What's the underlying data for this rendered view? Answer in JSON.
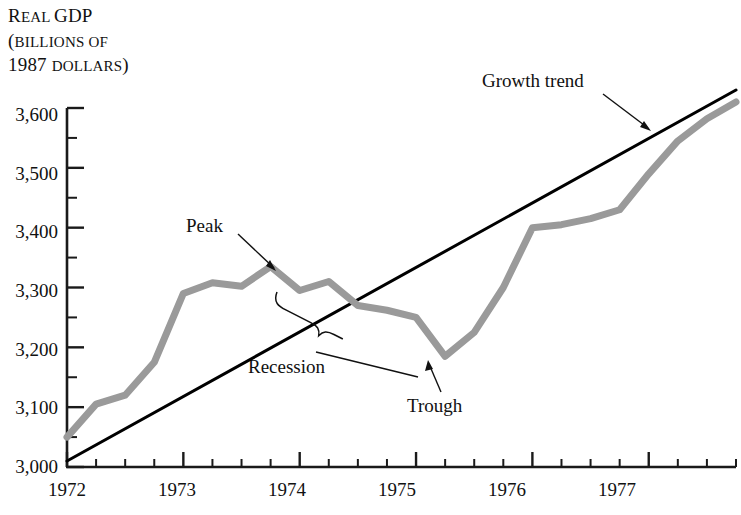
{
  "chart_data": {
    "type": "line",
    "title": "Real GDP (billions of 1987 dollars)",
    "title_lines": [
      {
        "head": "R",
        "rest": "EAL ",
        "head2": "GDP",
        "text": "Real GDP"
      },
      {
        "text": "(billions of"
      },
      {
        "text": "1987 dollars)"
      }
    ],
    "xlabel": "",
    "ylabel": "Real GDP (billions of 1987 dollars)",
    "ylim": [
      3000,
      3600
    ],
    "xlim": [
      1972.0,
      1977.75
    ],
    "grid": false,
    "legend": "none",
    "y_ticks": [
      "3,000",
      "3,100",
      "3,200",
      "3,300",
      "3,400",
      "3,500",
      "3,600"
    ],
    "y_tick_values": [
      3000,
      3100,
      3200,
      3300,
      3400,
      3500,
      3600
    ],
    "y_minor_step": 50,
    "x_ticks": [
      "1972",
      "1973",
      "1974",
      "1975",
      "1976",
      "1977"
    ],
    "x_tick_values": [
      1972,
      1973,
      1974,
      1975,
      1976,
      1977
    ],
    "x_minor_step": 0.25,
    "series": [
      {
        "name": "Real GDP",
        "color": "#9a9a9a",
        "width": 7,
        "x": [
          1972.0,
          1972.25,
          1972.5,
          1972.75,
          1973.0,
          1973.25,
          1973.5,
          1973.75,
          1974.0,
          1974.25,
          1974.5,
          1974.75,
          1975.0,
          1975.25,
          1975.5,
          1975.75,
          1976.0,
          1976.25,
          1976.5,
          1976.75,
          1977.0,
          1977.25,
          1977.5,
          1977.75
        ],
        "values": [
          3050,
          3105,
          3120,
          3175,
          3290,
          3308,
          3302,
          3335,
          3295,
          3310,
          3270,
          3262,
          3250,
          3185,
          3225,
          3300,
          3400,
          3405,
          3415,
          3430,
          3490,
          3545,
          3582,
          3610
        ]
      },
      {
        "name": "Growth trend",
        "color": "#000000",
        "width": 3,
        "x": [
          1972.0,
          1977.75
        ],
        "values": [
          3010,
          3630
        ]
      }
    ],
    "annotations": [
      {
        "name": "peak",
        "label": "Peak",
        "x": 1973.75,
        "y": 3335,
        "label_x": 1973.05,
        "label_y": 3440
      },
      {
        "name": "trough",
        "label": "Trough",
        "x": 1975.25,
        "y": 3185,
        "label_x": 1975.35,
        "label_y": 3090
      },
      {
        "name": "recession",
        "label": "Recession",
        "x": 1974.5,
        "y": 3265,
        "label_x": 1973.55,
        "label_y": 3125
      },
      {
        "name": "growth-trend",
        "label": "Growth trend",
        "x": 1977.0,
        "y": 3540,
        "label_x": 1976.35,
        "label_y": 3640
      }
    ]
  },
  "ytick_labels": {
    "t0": "3,000",
    "t1": "3,100",
    "t2": "3,200",
    "t3": "3,300",
    "t4": "3,400",
    "t5": "3,500",
    "t6": "3,600"
  },
  "xtick_labels": {
    "t0": "1972",
    "t1": "1973",
    "t2": "1974",
    "t3": "1975",
    "t4": "1976",
    "t5": "1977"
  },
  "title": {
    "line1_cap": "R",
    "line1_small": "EAL ",
    "line1_rest": "GDP",
    "line2_cap": "(",
    "line2_small": "BILLIONS OF",
    "line3_num": "1987 ",
    "line3_small": "DOLLARS",
    "line3_close": ")"
  },
  "annotations": {
    "peak": "Peak",
    "trough": "Trough",
    "recession": "Recession",
    "growth_trend": "Growth trend"
  },
  "colors": {
    "gdp_line": "#9a9a9a",
    "trend_line": "#000000",
    "axis": "#1a1a1a",
    "background": "#ffffff",
    "text": "#111111"
  }
}
